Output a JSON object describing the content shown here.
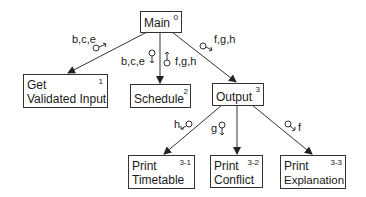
{
  "modules": {
    "main": {
      "name": "Main",
      "number": "0"
    },
    "get_validated_input": {
      "line1": "Get",
      "line2": "Validated Input",
      "number": "1"
    },
    "schedule": {
      "name": "Schedule",
      "number": "2"
    },
    "output": {
      "name": "Output",
      "number": "3"
    },
    "print_timetable": {
      "line1": "Print",
      "line2": "Timetable",
      "number": "3-1"
    },
    "print_conflict": {
      "line1": "Print",
      "line2": "Conflict",
      "number": "3-2"
    },
    "print_explanation": {
      "line1": "Print",
      "line2": "Explanation",
      "number": "3-3"
    }
  },
  "couples": {
    "main_to_input": "b,c,e",
    "main_to_schedule_down": "b,c,e",
    "schedule_to_main_up": "f,g,h",
    "main_to_output": "f,g,h",
    "output_to_timetable": "h",
    "output_to_conflict": "g",
    "output_to_explanation": "f"
  }
}
